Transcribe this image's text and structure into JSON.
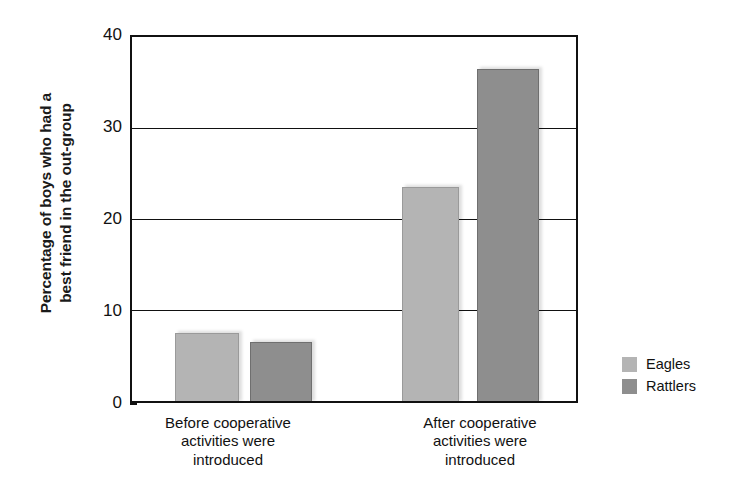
{
  "chart_data": {
    "type": "bar",
    "title": "",
    "subtitle": "",
    "xlabel": "",
    "ylabel": "Percentage of boys who had a best friend in the out-group",
    "ylabel_lines": [
      "Percentage of boys who had a",
      "best friend in the out-group"
    ],
    "categories": [
      "Before cooperative activities were introduced",
      "After cooperative activities were introduced"
    ],
    "category_lines": [
      [
        "Before cooperative",
        "activities were",
        "introduced"
      ],
      [
        "After cooperative",
        "activities were",
        "introduced"
      ]
    ],
    "series": [
      {
        "name": "Eagles",
        "color": "#b4b4b4",
        "values": [
          7.5,
          23.5
        ]
      },
      {
        "name": "Rattlers",
        "color": "#8e8e8e",
        "values": [
          6.5,
          36.5
        ]
      }
    ],
    "ylim": [
      0,
      40
    ],
    "yticks": [
      0,
      10,
      20,
      30,
      40
    ],
    "ytick_labels": [
      "0",
      "10",
      "20",
      "30",
      "40"
    ],
    "grid": true,
    "grid_axis": "y",
    "legend_position": "right",
    "legend": [
      "Eagles",
      "Rattlers"
    ]
  },
  "axis": {
    "y_title_line1": "Percentage of boys who had a",
    "y_title_line2": "best friend in the out-group",
    "ticks": [
      {
        "value": 40,
        "label": "40"
      },
      {
        "value": 30,
        "label": "30"
      },
      {
        "value": 20,
        "label": "20"
      },
      {
        "value": 10,
        "label": "10"
      },
      {
        "value": 0,
        "label": "0"
      }
    ]
  },
  "groups": [
    {
      "line1": "Before cooperative",
      "line2": "activities were",
      "line3": "introduced",
      "bars": [
        {
          "series": "Eagles",
          "value": 7.5
        },
        {
          "series": "Rattlers",
          "value": 6.5
        }
      ]
    },
    {
      "line1": "After cooperative",
      "line2": "activities were",
      "line3": "introduced",
      "bars": [
        {
          "series": "Eagles",
          "value": 23.5
        },
        {
          "series": "Rattlers",
          "value": 36.5
        }
      ]
    }
  ],
  "legend": {
    "items": [
      {
        "label": "Eagles",
        "color": "#b4b4b4"
      },
      {
        "label": "Rattlers",
        "color": "#8e8e8e"
      }
    ]
  }
}
